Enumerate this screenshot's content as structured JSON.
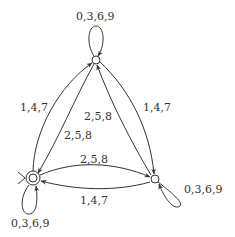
{
  "diagram": {
    "type": "finite-automaton",
    "colors": {
      "stroke": "#333333",
      "background": "#ffffff"
    },
    "nodes": [
      {
        "id": "q0",
        "x": 33,
        "y": 178,
        "start": true,
        "accepting": true
      },
      {
        "id": "q1",
        "x": 96,
        "y": 60,
        "start": false,
        "accepting": false
      },
      {
        "id": "q2",
        "x": 155,
        "y": 179,
        "start": false,
        "accepting": false
      }
    ],
    "edges": [
      {
        "from": "q0",
        "to": "q0",
        "label": "0,3,6,9"
      },
      {
        "from": "q1",
        "to": "q1",
        "label": "0,3,6,9"
      },
      {
        "from": "q2",
        "to": "q2",
        "label": "0,3,6,9"
      },
      {
        "from": "q0",
        "to": "q1",
        "label": "1,4,7"
      },
      {
        "from": "q1",
        "to": "q0",
        "label": "2,5,8"
      },
      {
        "from": "q2",
        "to": "q1",
        "label": "2,5,8"
      },
      {
        "from": "q1",
        "to": "q2",
        "label": "1,4,7"
      },
      {
        "from": "q0",
        "to": "q2",
        "label": "2,5,8"
      },
      {
        "from": "q2",
        "to": "q0",
        "label": "1,4,7"
      }
    ]
  },
  "labels": {
    "loop_top": "0,3,6,9",
    "loop_start": "0,3,6,9",
    "loop_right": "0,3,6,9",
    "start_to_top": "1,4,7",
    "top_to_start": "2,5,8",
    "right_to_top": "2,5,8",
    "top_to_right": "1,4,7",
    "start_to_right": "2,5,8",
    "right_to_start": "1,4,7"
  }
}
